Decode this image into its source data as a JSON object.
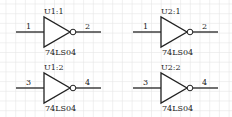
{
  "diagram": {
    "type": "logic-schematic",
    "grid": {
      "spacing": 9.7,
      "color": "#e6e6e6"
    },
    "wire_color": "#222222",
    "gates": [
      {
        "ref": "U1:1",
        "part": "74LS04",
        "input_pin": "1",
        "output_pin": "2",
        "cx": 0,
        "cy": 32
      },
      {
        "ref": "U2:1",
        "part": "74LS04",
        "input_pin": "1",
        "output_pin": "2",
        "cx": 117,
        "cy": 32
      },
      {
        "ref": "U1:2",
        "part": "74LS04",
        "input_pin": "3",
        "output_pin": "4",
        "cx": 0,
        "cy": 88
      },
      {
        "ref": "U2:2",
        "part": "74LS04",
        "input_pin": "3",
        "output_pin": "4",
        "cx": 117,
        "cy": 88
      }
    ]
  }
}
